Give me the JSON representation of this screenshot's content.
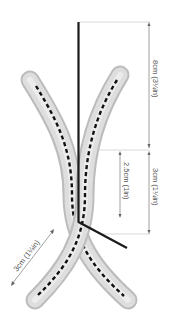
{
  "diagram": {
    "type": "technical-illustration",
    "colors": {
      "background": "#ffffff",
      "rod": "#1a1a1a",
      "bead_light": "#e6e6e6",
      "bead_mid": "#c8c8c8",
      "bead_dark": "#a8a8a8",
      "centerline": "#111111",
      "dimension_line": "#888888",
      "guide_line": "#cfcfcf",
      "label_text": "#555555"
    },
    "dimensions": [
      {
        "id": "rod-upper-length",
        "label": "8cm (3¼in)",
        "orientation": "vertical"
      },
      {
        "id": "rod-lower-length",
        "label": "3cm (1¼in)",
        "orientation": "vertical"
      },
      {
        "id": "rod-inner-length",
        "label": "2.5cm (1in)",
        "orientation": "vertical"
      },
      {
        "id": "tube-leg-length",
        "label": "3cm (1¼in)",
        "orientation": "diagonal"
      }
    ]
  }
}
